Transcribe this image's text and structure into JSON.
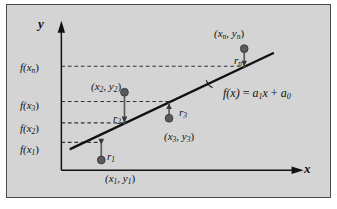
{
  "figure": {
    "kind": "least-squares-linear-regression-diagram",
    "background_color": "#d4d4d4",
    "page_color": "#ffffff",
    "border_color": "#4a4a4a",
    "line_color": "#111111",
    "dash_color": "#333333",
    "point_color": "#5a5a5a",
    "axes": {
      "y_axis_label": "y",
      "x_axis_label": "x",
      "y_axis_x_px": 52,
      "x_axis_y_px": 178,
      "y_axis_top_px": 22,
      "x_axis_right_px": 312
    },
    "fit_line": {
      "equation_label": "f(x) = a₁x + a₀",
      "equation_fx": "f(x)",
      "equation_eq": "=",
      "equation_a1": "a",
      "equation_a1_sub": "1",
      "equation_x": "x",
      "equation_plus": "+",
      "equation_a0": "a",
      "equation_a0_sub": "0",
      "x1_px": 62,
      "y1_px": 155,
      "x2_px": 280,
      "y2_px": 52
    },
    "tick_labels": [
      {
        "id": "fxn",
        "base": "f(x",
        "sub": "n",
        "close": ")",
        "x_px": 14,
        "y_px": 58,
        "dash_y_px": 66
      },
      {
        "id": "fx3",
        "base": "f(x",
        "sub": "3",
        "close": ")",
        "x_px": 14,
        "y_px": 97,
        "dash_y_px": 104
      },
      {
        "id": "fx2",
        "base": "f(x",
        "sub": "2",
        "close": ")",
        "x_px": 14,
        "y_px": 120,
        "dash_y_px": 127
      },
      {
        "id": "fx1",
        "base": "f(x",
        "sub": "1",
        "close": ")",
        "x_px": 14,
        "y_px": 141,
        "dash_y_px": 148
      }
    ],
    "data_points": [
      {
        "id": "p1",
        "coord_label": "(x₁, y₁)",
        "coord_open": "(x",
        "coord_sub1": "1",
        "coord_mid": ", y",
        "coord_sub2": "1",
        "coord_close": ")",
        "residual_label": "r",
        "residual_sub": "1",
        "dot_x_px": 95,
        "dot_y_px": 167,
        "line_top_y_px": 150,
        "coord_label_x_px": 100,
        "coord_label_y_px": 170,
        "residual_label_x_px": 100,
        "residual_label_y_px": 150
      },
      {
        "id": "p2",
        "coord_label": "(x₂, y₂)",
        "coord_open": "(x",
        "coord_sub1": "2",
        "coord_mid": ", y",
        "coord_sub2": "2",
        "coord_close": ")",
        "residual_label": "r",
        "residual_sub": "2",
        "dot_x_px": 120,
        "dot_y_px": 94,
        "line_bottom_y_px": 128,
        "coord_label_x_px": 86,
        "coord_label_y_px": 79,
        "residual_label_x_px": 107,
        "residual_label_y_px": 112
      },
      {
        "id": "p3",
        "coord_label": "(x₃, y₃)",
        "coord_open": "(x",
        "coord_sub1": "3",
        "coord_mid": ", y",
        "coord_sub2": "3",
        "coord_close": ")",
        "residual_label": "r",
        "residual_sub": "3",
        "dot_x_px": 168,
        "dot_y_px": 122,
        "line_top_y_px": 105,
        "coord_label_x_px": 159,
        "coord_label_y_px": 127,
        "residual_label_x_px": 172,
        "residual_label_y_px": 105
      },
      {
        "id": "pn",
        "coord_label": "(xₙ, yₙ)",
        "coord_open": "(x",
        "coord_sub1": "n",
        "coord_mid": ", y",
        "coord_sub2": "n",
        "coord_close": ")",
        "residual_label": "r",
        "residual_sub": "n",
        "dot_x_px": 249,
        "dot_y_px": 47,
        "line_bottom_y_px": 67,
        "coord_label_x_px": 209,
        "coord_label_y_px": 26,
        "residual_label_x_px": 227,
        "residual_label_y_px": 53
      }
    ],
    "equation_anchor": {
      "x_px": 216,
      "y_px": 86,
      "leader_from_x_px": 212,
      "leader_from_y_px": 80
    }
  }
}
